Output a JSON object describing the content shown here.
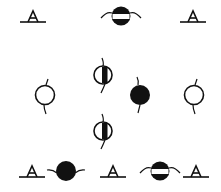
{
  "diagram": {
    "width": 221,
    "height": 192,
    "background": "#ffffff",
    "ink": "#111111",
    "symbols": [
      {
        "id": "tri-top-left",
        "type": "triangle-on-line",
        "x": 33,
        "y": 17
      },
      {
        "id": "band-top",
        "type": "banded-circle",
        "x": 121,
        "y": 16
      },
      {
        "id": "tri-top-right",
        "type": "triangle-on-line",
        "x": 193,
        "y": 17
      },
      {
        "id": "half-mid-upper",
        "type": "half-circle-vertical",
        "x": 103,
        "y": 75
      },
      {
        "id": "open-left",
        "type": "open-circle",
        "x": 45,
        "y": 95
      },
      {
        "id": "filled-mid",
        "type": "filled-circle",
        "x": 140,
        "y": 95
      },
      {
        "id": "open-right",
        "type": "open-circle",
        "x": 194,
        "y": 95
      },
      {
        "id": "half-mid-lower",
        "type": "half-circle-vertical",
        "x": 103,
        "y": 131
      },
      {
        "id": "tri-bottom-left",
        "type": "triangle-on-line",
        "x": 32,
        "y": 172
      },
      {
        "id": "filled-bottom",
        "type": "filled-circle-h",
        "x": 66,
        "y": 171
      },
      {
        "id": "tri-bottom-mid",
        "type": "triangle-on-line",
        "x": 113,
        "y": 172
      },
      {
        "id": "band-bottom",
        "type": "banded-circle",
        "x": 160,
        "y": 171
      },
      {
        "id": "tri-bottom-right",
        "type": "triangle-on-line",
        "x": 196,
        "y": 172
      }
    ]
  }
}
